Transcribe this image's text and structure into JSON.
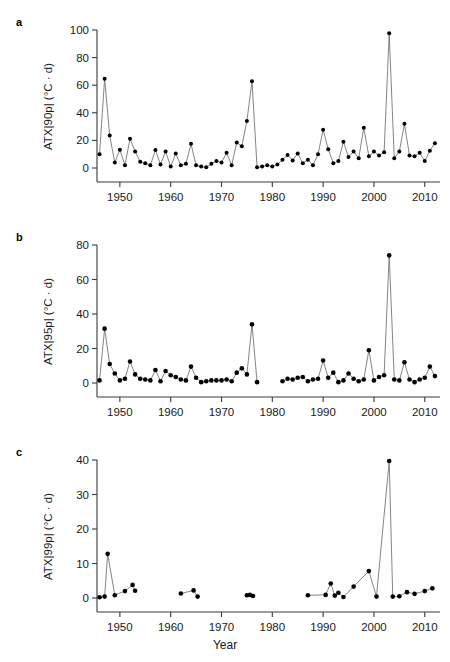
{
  "figure": {
    "xlabel": "Year",
    "panels": [
      {
        "letter": "a",
        "ylabel": "ATX|90p| (°C · d)"
      },
      {
        "letter": "b",
        "ylabel": "ATX|95p| (°C · d)"
      },
      {
        "letter": "c",
        "ylabel": "ATX|99p| (°C · d)"
      }
    ]
  },
  "chart_data": [
    {
      "type": "line",
      "panel": "a",
      "title": "",
      "xlabel": "Year",
      "ylabel": "ATX|90p| (°C · d)",
      "xlim": [
        1945.5,
        2013.0
      ],
      "ylim": [
        0,
        100
      ],
      "xticks": [
        1950,
        1960,
        1970,
        1980,
        1990,
        2000,
        2010
      ],
      "yticks": [
        0,
        20,
        40,
        60,
        80,
        100
      ],
      "grid": false,
      "legend": "none",
      "marker": "filled-circle",
      "x": [
        1946,
        1947,
        1948,
        1949,
        1950,
        1951,
        1952,
        1953,
        1954,
        1955,
        1956,
        1957,
        1958,
        1959,
        1960,
        1961,
        1962,
        1963,
        1964,
        1965,
        1966,
        1967,
        1968,
        1969,
        1970,
        1971,
        1972,
        1973,
        1974,
        1975,
        1976,
        1977,
        1978,
        1979,
        1980,
        1981,
        1982,
        1983,
        1984,
        1985,
        1986,
        1987,
        1988,
        1989,
        1990,
        1991,
        1992,
        1993,
        1994,
        1995,
        1996,
        1997,
        1998,
        1999,
        2000,
        2001,
        2002,
        2003,
        2004,
        2005,
        2006,
        2007,
        2008,
        2009,
        2010,
        2011,
        2012
      ],
      "values": [
        10.0,
        64.7,
        23.5,
        4.0,
        13.2,
        2.0,
        21.2,
        12.0,
        4.5,
        3.5,
        2.0,
        13.0,
        2.5,
        12.0,
        1.0,
        10.5,
        2.0,
        3.0,
        17.5,
        2.0,
        1.0,
        0.5,
        3.0,
        5.0,
        4.0,
        11.0,
        2.0,
        18.5,
        15.8,
        34.0,
        62.8,
        0.5,
        1.0,
        2.0,
        1.0,
        2.5,
        6.0,
        9.5,
        5.5,
        10.5,
        3.5,
        6.0,
        2.0,
        10.0,
        27.8,
        13.5,
        3.5,
        5.0,
        19.0,
        8.0,
        12.0,
        7.0,
        29.2,
        8.5,
        12.0,
        9.0,
        11.5,
        97.6,
        7.0,
        12.0,
        32.0,
        9.0,
        8.5,
        11.0,
        5.0,
        12.5,
        18.0
      ]
    },
    {
      "type": "line",
      "panel": "b",
      "title": "",
      "xlabel": "Year",
      "ylabel": "ATX|95p| (°C · d)",
      "xlim": [
        1945.5,
        2013.0
      ],
      "ylim": [
        0,
        80
      ],
      "xticks": [
        1950,
        1960,
        1970,
        1980,
        1990,
        2000,
        2010
      ],
      "yticks": [
        0,
        20,
        40,
        60,
        80
      ],
      "grid": false,
      "legend": "none",
      "marker": "filled-circle",
      "x": [
        1946,
        1947,
        1948,
        1949,
        1950,
        1951,
        1952,
        1953,
        1954,
        1955,
        1956,
        1957,
        1958,
        1959,
        1960,
        1961,
        1962,
        1963,
        1964,
        1965,
        1966,
        1967,
        1968,
        1969,
        1970,
        1971,
        1972,
        1973,
        1974,
        1975,
        1976,
        1977,
        1982,
        1983,
        1984,
        1985,
        1986,
        1987,
        1988,
        1989,
        1990,
        1991,
        1992,
        1993,
        1994,
        1995,
        1996,
        1997,
        1998,
        1999,
        2000,
        2001,
        2002,
        2003,
        2004,
        2005,
        2006,
        2007,
        2008,
        2009,
        2010,
        2011,
        2012
      ],
      "values": [
        1.5,
        31.5,
        11.0,
        5.5,
        1.5,
        2.5,
        12.5,
        5.0,
        2.5,
        2.0,
        1.5,
        7.5,
        1.0,
        7.0,
        4.5,
        3.5,
        2.0,
        1.5,
        9.5,
        3.0,
        0.5,
        1.0,
        1.5,
        1.5,
        1.5,
        2.0,
        1.0,
        6.0,
        8.5,
        5.0,
        34.0,
        0.5,
        1.0,
        2.5,
        2.0,
        3.0,
        3.5,
        1.0,
        2.0,
        2.5,
        13.0,
        3.0,
        6.0,
        0.5,
        1.5,
        5.5,
        2.5,
        1.0,
        2.0,
        19.0,
        1.5,
        3.5,
        4.5,
        74.0,
        2.0,
        1.5,
        12.0,
        2.0,
        0.5,
        2.0,
        3.0,
        9.5,
        4.0
      ]
    },
    {
      "type": "line",
      "panel": "c",
      "title": "",
      "xlabel": "Year",
      "ylabel": "ATX|99p| (°C · d)",
      "xlim": [
        1945.5,
        2013.0
      ],
      "ylim": [
        0,
        40
      ],
      "xticks": [
        1950,
        1960,
        1970,
        1980,
        1990,
        2000,
        2010
      ],
      "yticks": [
        0,
        10,
        20,
        30,
        40
      ],
      "grid": false,
      "legend": "none",
      "marker": "filled-circle",
      "x": [
        1946,
        1947,
        1947.6,
        1949,
        1951,
        1952.5,
        1953,
        1962,
        1964.5,
        1965.3,
        1975,
        1975.6,
        1976.2,
        1987,
        1990.5,
        1991.5,
        1992.3,
        1993,
        1994,
        1996,
        1999,
        2000.5,
        2003,
        2003.7,
        2005,
        2006.5,
        2008,
        2010,
        2011.5
      ],
      "values": [
        0.2,
        0.4,
        12.8,
        0.8,
        2.0,
        3.8,
        2.1,
        1.3,
        2.2,
        0.4,
        0.8,
        0.9,
        0.6,
        0.8,
        0.9,
        4.2,
        0.7,
        1.5,
        0.3,
        3.3,
        7.8,
        0.4,
        39.7,
        0.4,
        0.5,
        1.7,
        1.2,
        2.0,
        2.8
      ]
    }
  ]
}
